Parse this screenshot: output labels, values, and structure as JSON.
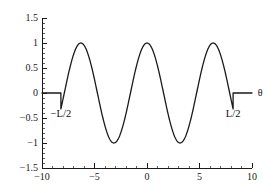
{
  "chart_data": {
    "type": "line",
    "title": "",
    "subtitle": "",
    "xlabel": "",
    "ylabel": "",
    "xlim": [
      -10,
      10
    ],
    "ylim": [
      -1.5,
      1.5
    ],
    "grid": false,
    "legend": null,
    "legend_position": "none",
    "x_ticks": [
      -10,
      -5,
      0,
      5,
      10
    ],
    "x_tick_labels": [
      "-10",
      "-5",
      "0",
      "5",
      "10"
    ],
    "x_minor_tick_step": 1,
    "y_ticks": [
      1.5,
      1,
      0.5,
      0,
      -0.5,
      -1,
      -1.5
    ],
    "y_tick_labels": [
      "1.5",
      "1",
      "0.5",
      "0",
      "-0.5",
      "-1",
      "-1.5"
    ],
    "y_minor_tick_step": 0.1,
    "line_color": "#1a1a1a",
    "line_width": 1.3,
    "annotations": [
      {
        "name": "left-truncation-label",
        "text": "−L/2",
        "x": -8.2,
        "y": -0.42
      },
      {
        "name": "right-truncation-label",
        "text": "L/2",
        "x": 8.2,
        "y": -0.42
      },
      {
        "name": "x-axis-symbol",
        "text": "θ",
        "x": 10.55,
        "y": 0.0
      }
    ],
    "series": [
      {
        "name": "truncated-cosine",
        "color": "#1a1a1a",
        "points": [
          [
            -10.0,
            0.0
          ],
          [
            -9.6,
            0.0
          ],
          [
            -9.2,
            0.0
          ],
          [
            -8.8,
            0.0
          ],
          [
            -8.4,
            0.0
          ],
          [
            -8.2,
            0.0
          ],
          [
            -8.0,
            0.152
          ],
          [
            -7.8,
            0.306
          ],
          [
            -7.6,
            0.454
          ],
          [
            -7.4,
            0.592
          ],
          [
            -7.2,
            0.714
          ],
          [
            -7.0,
            0.817
          ],
          [
            -6.8,
            0.898
          ],
          [
            -6.6,
            0.954
          ],
          [
            -6.4,
            0.985
          ],
          [
            -6.28,
            0.995
          ],
          [
            -6.1,
            0.988
          ],
          [
            -5.9,
            0.96
          ],
          [
            -5.7,
            0.908
          ],
          [
            -5.5,
            0.833
          ],
          [
            -5.3,
            0.738
          ],
          [
            -5.1,
            0.626
          ],
          [
            -4.9,
            0.5
          ],
          [
            -4.7,
            0.363
          ],
          [
            -4.5,
            0.219
          ],
          [
            -4.3,
            0.071
          ],
          [
            -4.1,
            -0.078
          ],
          [
            -3.9,
            -0.224
          ],
          [
            -3.7,
            -0.366
          ],
          [
            -3.5,
            -0.5
          ],
          [
            -3.3,
            -0.624
          ],
          [
            -3.14,
            -0.712
          ],
          [
            -3.0,
            -0.776
          ],
          [
            -2.8,
            -0.856
          ],
          [
            -2.6,
            -0.92
          ],
          [
            -2.4,
            -0.966
          ],
          [
            -2.2,
            -0.992
          ],
          [
            -2.0,
            -0.999
          ],
          [
            -1.8,
            -0.985
          ],
          [
            -1.6,
            -0.952
          ],
          [
            -1.4,
            -0.9
          ],
          [
            -1.2,
            -0.829
          ],
          [
            -1.0,
            -0.741
          ],
          [
            -0.8,
            -0.638
          ],
          [
            -0.6,
            -0.521
          ],
          [
            -0.4,
            -0.394
          ],
          [
            -0.2,
            -0.258
          ],
          [
            0.0,
            -0.117
          ],
          [
            0.2,
            0.027
          ],
          [
            0.4,
            0.17
          ],
          [
            0.6,
            0.309
          ],
          [
            0.8,
            0.442
          ],
          [
            1.0,
            0.565
          ],
          [
            1.2,
            0.676
          ],
          [
            1.4,
            0.773
          ],
          [
            1.6,
            0.853
          ],
          [
            1.8,
            0.915
          ],
          [
            2.0,
            0.958
          ],
          [
            2.2,
            0.984
          ],
          [
            2.4,
            0.994
          ],
          [
            2.6,
            0.987
          ],
          [
            2.8,
            0.962
          ],
          [
            3.0,
            0.918
          ]
        ]
      }
    ],
    "formula": "y(θ) = cos(kθ) for |θ| <= L/2, 0 otherwise",
    "wave_peaks_x": [
      -6.3,
      0.0,
      6.3
    ],
    "wave_troughs_x": [
      -3.15,
      3.15
    ],
    "truncation_left_x": -8.2,
    "truncation_right_x": 8.2,
    "amplitude": 1.0,
    "period": 6.3
  },
  "figure": {
    "background_color": "#ffffff",
    "axes_color": "#1a1a1a"
  }
}
